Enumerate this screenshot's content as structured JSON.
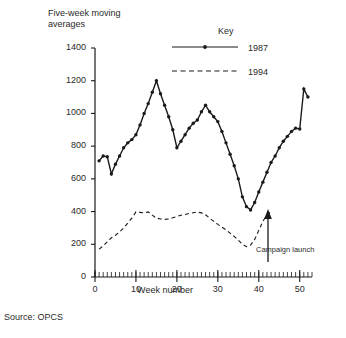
{
  "figure": {
    "y_axis_title": "Five-week moving\naverages",
    "x_axis_title": "Week number",
    "source_note": "Source:  OPCS",
    "annotation": "Campaign launch",
    "key_title": "Key"
  },
  "chart_data": {
    "type": "line",
    "title": "Five-week moving averages",
    "xlabel": "Week number",
    "ylabel": "Five-week moving averages",
    "xlim": [
      0,
      53
    ],
    "ylim": [
      0,
      1400
    ],
    "xticks": [
      0,
      10,
      20,
      30,
      40,
      50
    ],
    "yticks": [
      0,
      200,
      400,
      600,
      800,
      1000,
      1200,
      1400
    ],
    "minor_xtick_interval": 1,
    "grid": false,
    "legend_position": "top-right",
    "annotations": [
      {
        "text": "Campaign launch",
        "week": 43,
        "value": 400,
        "marker": "up-arrow"
      }
    ],
    "source": "Source:  OPCS",
    "series": [
      {
        "name": "1987",
        "style": "solid",
        "marker": "filled-circle",
        "x": [
          1,
          2,
          3,
          4,
          5,
          6,
          7,
          8,
          9,
          10,
          11,
          12,
          13,
          14,
          15,
          16,
          17,
          18,
          19,
          20,
          21,
          22,
          23,
          24,
          25,
          26,
          27,
          28,
          29,
          30,
          31,
          32,
          33,
          34,
          35,
          36,
          37,
          38,
          39,
          40,
          41,
          42,
          43,
          44,
          45,
          46,
          47,
          48,
          49,
          50,
          51,
          52
        ],
        "values": [
          710,
          740,
          735,
          630,
          690,
          740,
          790,
          820,
          840,
          870,
          930,
          1000,
          1060,
          1130,
          1200,
          1120,
          1050,
          980,
          900,
          790,
          830,
          870,
          910,
          940,
          960,
          1010,
          1050,
          1010,
          980,
          950,
          890,
          820,
          750,
          680,
          600,
          490,
          430,
          410,
          455,
          520,
          580,
          640,
          700,
          740,
          790,
          830,
          860,
          890,
          910,
          905,
          1150,
          1100
        ]
      },
      {
        "name": "1994",
        "style": "dashed",
        "marker": "none",
        "x": [
          1,
          2,
          3,
          4,
          5,
          6,
          7,
          8,
          9,
          10,
          11,
          12,
          13,
          14,
          15,
          16,
          17,
          18,
          19,
          20,
          21,
          22,
          23,
          24,
          25,
          26,
          27,
          28,
          29,
          30,
          31,
          32,
          33,
          34,
          35,
          36,
          37,
          38,
          39,
          40,
          41,
          42,
          43
        ],
        "values": [
          170,
          190,
          215,
          240,
          255,
          275,
          300,
          330,
          360,
          398,
          395,
          392,
          398,
          378,
          360,
          355,
          352,
          355,
          362,
          370,
          378,
          382,
          388,
          393,
          397,
          392,
          380,
          360,
          340,
          322,
          305,
          288,
          268,
          248,
          225,
          200,
          185,
          195,
          230,
          285,
          340,
          380,
          400
        ]
      }
    ]
  },
  "legend": {
    "items": [
      {
        "label": "1987",
        "style": "solid"
      },
      {
        "label": "1994",
        "style": "dashed"
      }
    ]
  },
  "axes": {
    "y_tick_labels": [
      "1400",
      "1200",
      "1000",
      "800",
      "600",
      "400",
      "200",
      "0"
    ],
    "x_tick_labels": [
      "0",
      "10",
      "20",
      "30",
      "40",
      "50"
    ]
  }
}
